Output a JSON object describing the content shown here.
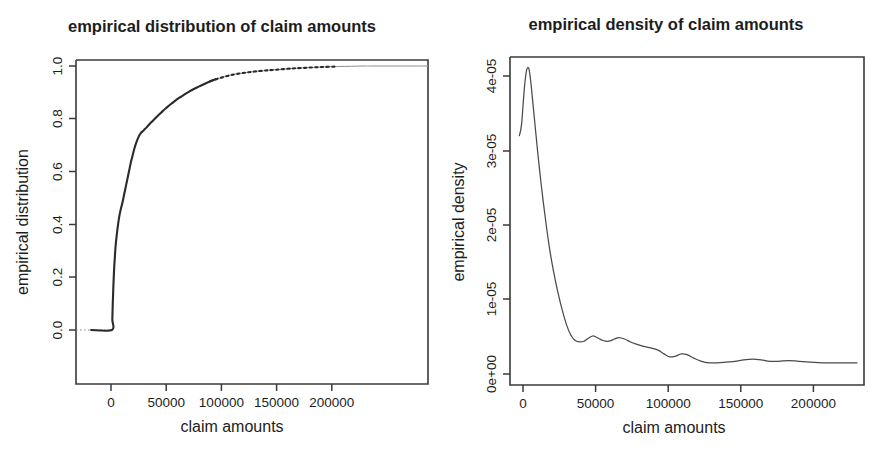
{
  "figure": {
    "background_color": "#ffffff",
    "line_color": "#3a3a3a",
    "text_color": "#1d1d1d",
    "panel_count": 2
  },
  "panels": [
    {
      "id": "empirical-distribution",
      "title": "empirical distribution of claim amounts",
      "xlabel": "claim amounts",
      "ylabel": "empirical distribution",
      "x_ticks": [
        "0",
        "50000",
        "100000",
        "150000",
        "200000"
      ],
      "y_ticks": [
        "0.0",
        "0.2",
        "0.4",
        "0.6",
        "0.8",
        "1.0"
      ]
    },
    {
      "id": "empirical-density",
      "title": "empirical density of claim amounts",
      "xlabel": "claim amounts",
      "ylabel": "empirical density",
      "x_ticks": [
        "0",
        "50000",
        "100000",
        "150000",
        "200000"
      ],
      "y_ticks": [
        "0e+00",
        "1e-05",
        "2e-05",
        "3e-05",
        "4e-05"
      ]
    }
  ],
  "chart_data": [
    {
      "type": "line",
      "id": "empirical-distribution",
      "title": "empirical distribution of claim amounts",
      "xlabel": "claim amounts",
      "ylabel": "empirical distribution",
      "xlim": [
        -18000,
        238000
      ],
      "ylim": [
        -0.04,
        1.06
      ],
      "x_ticks": [
        0,
        50000,
        100000,
        150000,
        200000
      ],
      "y_ticks": [
        0.0,
        0.2,
        0.4,
        0.6,
        0.8,
        1.0
      ],
      "grid": false,
      "legend": null,
      "series": [
        {
          "name": "empirical CDF",
          "style": "step-like increasing curve, near-vertical rise then concave approach to 1",
          "x": [
            -18000,
            900,
            1200,
            1600,
            2100,
            2700,
            3400,
            4200,
            5200,
            6400,
            7700,
            9000,
            10500,
            12000,
            13500,
            15000,
            16500,
            18000,
            19500,
            21000,
            22500,
            24000,
            25500,
            27000,
            29000,
            31000,
            33000,
            35000,
            38000,
            41000,
            44000,
            47000,
            50000,
            54000,
            58000,
            62000,
            66000,
            70000,
            75000,
            80000,
            85000,
            90000,
            95000,
            100000,
            107000,
            114000,
            122000,
            130000,
            140000,
            150000,
            162000,
            175000,
            190000,
            205000,
            218000,
            230000,
            238000
          ],
          "y": [
            0.0,
            0.0,
            0.04,
            0.1,
            0.16,
            0.22,
            0.27,
            0.32,
            0.36,
            0.4,
            0.435,
            0.46,
            0.485,
            0.515,
            0.545,
            0.575,
            0.605,
            0.635,
            0.66,
            0.685,
            0.705,
            0.722,
            0.736,
            0.746,
            0.754,
            0.762,
            0.771,
            0.78,
            0.793,
            0.806,
            0.818,
            0.83,
            0.841,
            0.855,
            0.868,
            0.88,
            0.891,
            0.901,
            0.913,
            0.923,
            0.933,
            0.942,
            0.95,
            0.956,
            0.964,
            0.97,
            0.975,
            0.979,
            0.983,
            0.986,
            0.99,
            0.993,
            0.996,
            0.998,
            0.999,
            1.0,
            1.0
          ]
        }
      ]
    },
    {
      "type": "line",
      "id": "empirical-density",
      "title": "empirical density of claim amounts",
      "xlabel": "claim amounts",
      "ylabel": "empirical density",
      "xlim": [
        -9000,
        232000
      ],
      "ylim": [
        -1.5e-06,
        4.45e-05
      ],
      "x_ticks": [
        0,
        50000,
        100000,
        150000,
        200000
      ],
      "y_ticks": [
        "0e+00",
        "1e-05",
        "2e-05",
        "3e-05",
        "4e-05"
      ],
      "y_tick_values": [
        0.0,
        1e-05,
        2e-05,
        3e-05,
        4e-05
      ],
      "grid": false,
      "legend": null,
      "series": [
        {
          "name": "kernel density estimate",
          "style": "sharp unimodal peak near 5000 then long wavy decaying tail",
          "x": [
            -2500,
            -1000,
            1000,
            2500,
            4000,
            5200,
            6500,
            8000,
            10000,
            12500,
            15000,
            18000,
            21000,
            24000,
            27000,
            30000,
            33000,
            36000,
            39000,
            42000,
            45000,
            48000,
            51000,
            55000,
            59000,
            63000,
            66000,
            70000,
            74000,
            78000,
            83000,
            88000,
            93000,
            97000,
            101000,
            105000,
            109000,
            113000,
            118000,
            123000,
            128000,
            134000,
            140000,
            146000,
            152000,
            158000,
            164000,
            170000,
            176000,
            183000,
            190000,
            198000,
            206000,
            215000,
            224000,
            230000
          ],
          "y": [
            3.2e-05,
            3.35e-05,
            3.85e-05,
            4.08e-05,
            4.1e-05,
            3.95e-05,
            3.7e-05,
            3.4e-05,
            3e-05,
            2.55e-05,
            2.15e-05,
            1.72e-05,
            1.38e-05,
            1.1e-05,
            8.6e-06,
            6.6e-06,
            5.2e-06,
            4.5e-06,
            4.3e-06,
            4.4e-06,
            4.8e-06,
            5.1e-06,
            4.9e-06,
            4.5e-06,
            4.4e-06,
            4.7e-06,
            4.9e-06,
            4.7e-06,
            4.3e-06,
            4e-06,
            3.7e-06,
            3.5e-06,
            3.2e-06,
            2.7e-06,
            2.3e-06,
            2.4e-06,
            2.7e-06,
            2.6e-06,
            2.1e-06,
            1.7e-06,
            1.5e-06,
            1.5e-06,
            1.6e-06,
            1.7e-06,
            1.9e-06,
            2e-06,
            1.9e-06,
            1.7e-06,
            1.7e-06,
            1.8e-06,
            1.7e-06,
            1.6e-06,
            1.5e-06,
            1.5e-06,
            1.5e-06,
            1.5e-06
          ]
        }
      ]
    }
  ]
}
